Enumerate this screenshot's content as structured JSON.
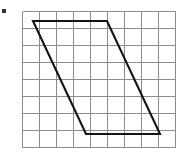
{
  "figure": {
    "name": "parallelogram-on-square-grid",
    "background_color": "#ffffff",
    "grid": {
      "line_color": "#8c8c8c",
      "line_width": 1,
      "columns": 9,
      "rows": 8,
      "cell_size": 17,
      "origin_x": 22,
      "origin_y": 11,
      "width": 153,
      "height": 136
    },
    "shape": {
      "type": "parallelogram",
      "stroke_color": "#141414",
      "stroke_width": 2.1,
      "fill": "none",
      "closed": true,
      "vertex_labels": [
        "top-left",
        "top-right",
        "bottom-right",
        "bottom-left"
      ],
      "vertices_px": [
        {
          "x": 33,
          "y": 21
        },
        {
          "x": 107,
          "y": 21
        },
        {
          "x": 160,
          "y": 134
        },
        {
          "x": 86,
          "y": 134
        }
      ],
      "vertices_grid": [
        {
          "col": 0.65,
          "row": 0.6
        },
        {
          "col": 5.0,
          "row": 0.6
        },
        {
          "col": 8.1,
          "row": 7.25
        },
        {
          "col": 3.75,
          "row": 7.25
        }
      ],
      "edges": [
        {
          "name": "top-edge",
          "from": "top-left",
          "to": "top-right",
          "orientation": "horizontal"
        },
        {
          "name": "right-edge",
          "from": "top-right",
          "to": "bottom-right",
          "orientation": "slanted"
        },
        {
          "name": "bottom-edge",
          "from": "bottom-right",
          "to": "bottom-left",
          "orientation": "horizontal"
        },
        {
          "name": "left-edge",
          "from": "bottom-left",
          "to": "top-left",
          "orientation": "slanted"
        }
      ],
      "base_cells": 4.35,
      "height_cells": 6.65
    },
    "marker": {
      "name": "corner-dot",
      "color": "#333333",
      "x": 2,
      "y": 9,
      "width": 4,
      "height": 4
    }
  }
}
